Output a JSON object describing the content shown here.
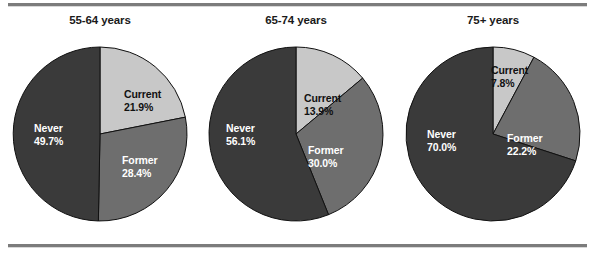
{
  "figure": {
    "background": "#ffffff",
    "rule_color": "#7c7c7c"
  },
  "palette": {
    "current": "#c8c8c8",
    "former": "#6e6e6e",
    "never": "#3a3a3a",
    "outline": "#111111",
    "label_light_bg_text": "#111111",
    "label_dark_bg_text": "#ffffff"
  },
  "charts": [
    {
      "title": "55-64 years",
      "slices": [
        {
          "name": "Current",
          "percent_text": "21.9%",
          "value": 21.9,
          "color": "#c8c8c8",
          "text_on": "light"
        },
        {
          "name": "Former",
          "percent_text": "28.4%",
          "value": 28.4,
          "color": "#6e6e6e",
          "text_on": "dark"
        },
        {
          "name": "Never",
          "percent_text": "49.7%",
          "value": 49.7,
          "color": "#3a3a3a",
          "text_on": "dark"
        }
      ]
    },
    {
      "title": "65-74 years",
      "slices": [
        {
          "name": "Current",
          "percent_text": "13.9%",
          "value": 13.9,
          "color": "#c8c8c8",
          "text_on": "light"
        },
        {
          "name": "Former",
          "percent_text": "30.0%",
          "value": 30.0,
          "color": "#6e6e6e",
          "text_on": "dark"
        },
        {
          "name": "Never",
          "percent_text": "56.1%",
          "value": 56.1,
          "color": "#3a3a3a",
          "text_on": "dark"
        }
      ]
    },
    {
      "title": "75+ years",
      "slices": [
        {
          "name": "Current",
          "percent_text": "7.8%",
          "value": 7.8,
          "color": "#c8c8c8",
          "text_on": "light"
        },
        {
          "name": "Former",
          "percent_text": "22.2%",
          "value": 22.2,
          "color": "#6e6e6e",
          "text_on": "dark"
        },
        {
          "name": "Never",
          "percent_text": "70.0%",
          "value": 70.0,
          "color": "#3a3a3a",
          "text_on": "dark"
        }
      ]
    }
  ],
  "chart_data": [
    {
      "type": "pie",
      "title": "55-64 years",
      "categories": [
        "Current",
        "Former",
        "Never"
      ],
      "values": [
        21.9,
        28.4,
        49.7
      ],
      "labels": [
        "21.9%",
        "28.4%",
        "49.7%"
      ],
      "colors": [
        "#c8c8c8",
        "#6e6e6e",
        "#3a3a3a"
      ],
      "start_angle_deg": 0,
      "direction": "clockwise",
      "legend": "none",
      "data_labels": "inside-slice"
    },
    {
      "type": "pie",
      "title": "65-74 years",
      "categories": [
        "Current",
        "Former",
        "Never"
      ],
      "values": [
        13.9,
        30.0,
        56.1
      ],
      "labels": [
        "13.9%",
        "30.0%",
        "56.1%"
      ],
      "colors": [
        "#c8c8c8",
        "#6e6e6e",
        "#3a3a3a"
      ],
      "start_angle_deg": 0,
      "direction": "clockwise",
      "legend": "none",
      "data_labels": "inside-slice"
    },
    {
      "type": "pie",
      "title": "75+ years",
      "categories": [
        "Current",
        "Former",
        "Never"
      ],
      "values": [
        7.8,
        22.2,
        70.0
      ],
      "labels": [
        "7.8%",
        "22.2%",
        "70.0%"
      ],
      "colors": [
        "#c8c8c8",
        "#6e6e6e",
        "#3a3a3a"
      ],
      "start_angle_deg": 0,
      "direction": "clockwise",
      "legend": "none",
      "data_labels": "inside-slice"
    }
  ],
  "label_positions": [
    [
      {
        "left": 112,
        "top": 42
      },
      {
        "left": 110,
        "top": 108
      },
      {
        "left": 22,
        "top": 76
      }
    ],
    [
      {
        "left": 96,
        "top": 46
      },
      {
        "left": 100,
        "top": 98
      },
      {
        "left": 18,
        "top": 76
      }
    ],
    [
      {
        "left": 86,
        "top": 18
      },
      {
        "left": 102,
        "top": 86
      },
      {
        "left": 22,
        "top": 82
      }
    ]
  ]
}
